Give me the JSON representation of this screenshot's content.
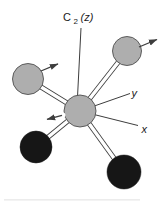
{
  "figure": {
    "type": "molecule-symmetry-diagram",
    "rotation_axis_label": {
      "element": "C",
      "subscript": "2",
      "axis_suffix": "(z)"
    },
    "coordinate_labels": {
      "y": "y",
      "x": "x"
    }
  },
  "colors": {
    "background": "#ffffff",
    "line": "#3d3d3d",
    "bond_fill": "#ffffff",
    "atom_gray": "#aeaeae",
    "atom_gray_edge": "#4f4f4f",
    "atom_black": "#161616",
    "caption_remnant": "#ececec"
  }
}
